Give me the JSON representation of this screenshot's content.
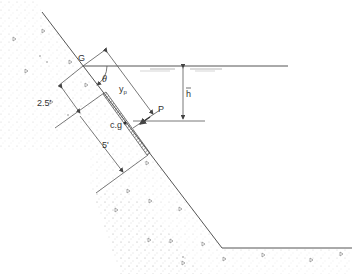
{
  "figure": {
    "labels": {
      "G": "G",
      "theta": "θ",
      "yp": "y",
      "yp_sub": "p",
      "P": "P",
      "hbar": "h",
      "cg": "c.g",
      "dim_top": "2.5'",
      "dim_bottom": "5'"
    }
  },
  "colors": {
    "line": "#555555",
    "soil_dot": "#bbbbbb",
    "text": "#333333"
  }
}
